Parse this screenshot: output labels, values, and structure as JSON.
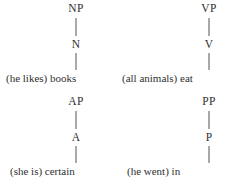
{
  "figure": {
    "kind": "phrase-structure-tree-set",
    "background_color": "#ffffff",
    "text_color": "#2f2f2f",
    "branch_color": "#55555a",
    "trees": [
      {
        "id": "np-tree",
        "phrase_label": "NP",
        "head_label": "N",
        "terminal": "(he likes) books"
      },
      {
        "id": "vp-tree",
        "phrase_label": "VP",
        "head_label": "V",
        "terminal": "(all animals) eat"
      },
      {
        "id": "ap-tree",
        "phrase_label": "AP",
        "head_label": "A",
        "terminal": "(she is) certain"
      },
      {
        "id": "pp-tree",
        "phrase_label": "PP",
        "head_label": "P",
        "terminal": "(he went) in"
      }
    ]
  }
}
